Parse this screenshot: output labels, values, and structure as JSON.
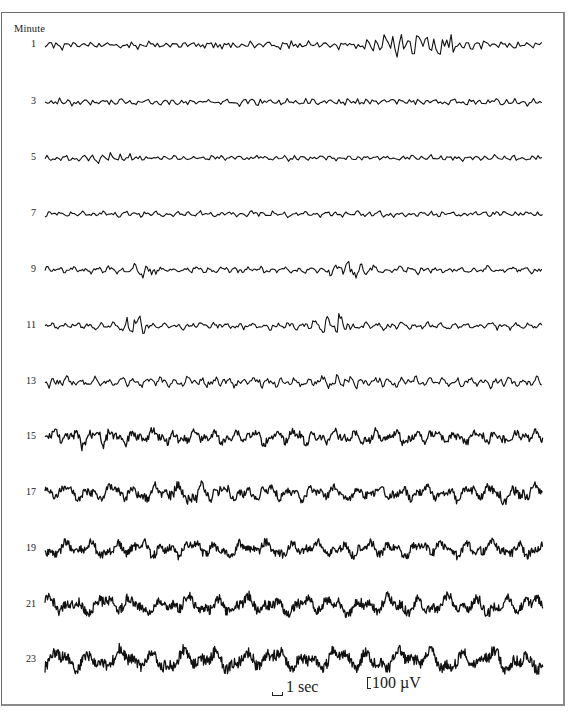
{
  "figure": {
    "header": "Minute",
    "frame_color": "#6e6e6e",
    "trace_color": "#111111",
    "trace_x_start": 45,
    "trace_x_end": 543
  },
  "traces": [
    {
      "minute": "1",
      "y": 45,
      "amp": 3.2,
      "freq": 2.4,
      "seed": 11,
      "bursts": [
        {
          "at": 0.75,
          "width": 0.08,
          "gain": 4.5
        }
      ]
    },
    {
      "minute": "3",
      "y": 102,
      "amp": 3.0,
      "freq": 2.3,
      "seed": 23,
      "bursts": []
    },
    {
      "minute": "5",
      "y": 158,
      "amp": 2.4,
      "freq": 2.2,
      "seed": 37,
      "bursts": [
        {
          "at": 0.12,
          "width": 0.05,
          "gain": 1.6
        }
      ]
    },
    {
      "minute": "7",
      "y": 214,
      "amp": 2.6,
      "freq": 1.9,
      "seed": 41,
      "bursts": []
    },
    {
      "minute": "9",
      "y": 270,
      "amp": 3.0,
      "freq": 1.6,
      "seed": 53,
      "bursts": [
        {
          "at": 0.2,
          "width": 0.02,
          "gain": 3.2
        },
        {
          "at": 0.61,
          "width": 0.04,
          "gain": 2.6
        }
      ]
    },
    {
      "minute": "11",
      "y": 326,
      "amp": 3.0,
      "freq": 1.6,
      "seed": 67,
      "bursts": [
        {
          "at": 0.18,
          "width": 0.02,
          "gain": 4.2
        },
        {
          "at": 0.58,
          "width": 0.03,
          "gain": 4.0
        }
      ]
    },
    {
      "minute": "13",
      "y": 382,
      "amp": 4.2,
      "freq": 1.5,
      "seed": 79,
      "bursts": [
        {
          "at": 0.6,
          "width": 0.05,
          "gain": 1.6
        }
      ]
    },
    {
      "minute": "15",
      "y": 437,
      "amp": 6.5,
      "freq": 1.0,
      "seed": 83,
      "bursts": [
        {
          "at": 0.1,
          "width": 0.04,
          "gain": 1.6
        }
      ]
    },
    {
      "minute": "17",
      "y": 493,
      "amp": 7.0,
      "freq": 0.9,
      "seed": 97,
      "bursts": [
        {
          "at": 0.3,
          "width": 0.06,
          "gain": 1.5
        },
        {
          "at": 0.93,
          "width": 0.04,
          "gain": 1.4
        }
      ]
    },
    {
      "minute": "19",
      "y": 549,
      "amp": 7.5,
      "freq": 0.8,
      "seed": 101,
      "bursts": []
    },
    {
      "minute": "21",
      "y": 605,
      "amp": 9.0,
      "freq": 0.7,
      "seed": 113,
      "bursts": []
    },
    {
      "minute": "23",
      "y": 660,
      "amp": 10.5,
      "freq": 0.65,
      "seed": 127,
      "bursts": []
    }
  ],
  "scale": {
    "time_label": "1 sec",
    "voltage_label": "100 µV"
  },
  "chart_data": {
    "type": "line",
    "title": "",
    "xlabel": "time (traces span ~25 s each; scale bar = 1 sec)",
    "ylabel": "Minute",
    "row_labels": [
      "1",
      "3",
      "5",
      "7",
      "9",
      "11",
      "13",
      "15",
      "17",
      "19",
      "21",
      "23"
    ],
    "scale_bars": {
      "time": "1 sec",
      "amplitude": "100 µV"
    },
    "grid": false,
    "legend": null
  }
}
